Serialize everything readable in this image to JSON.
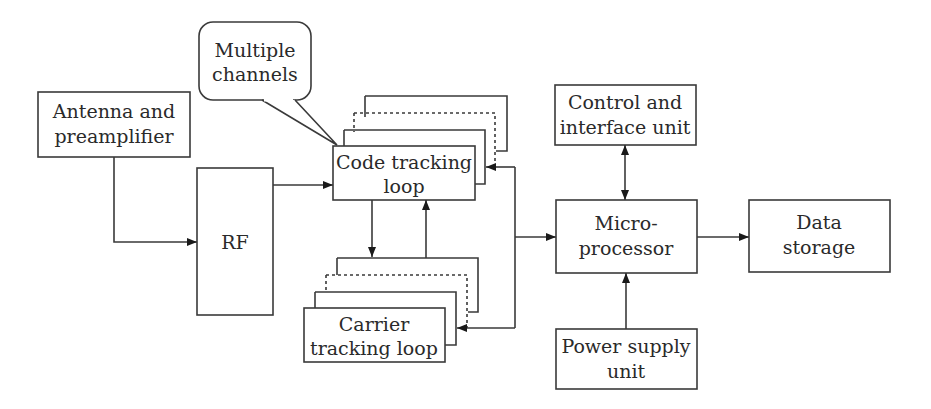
{
  "diagram": {
    "type": "block-diagram",
    "blocks": {
      "antenna": {
        "line1": "Antenna and",
        "line2": "preamplifier"
      },
      "rf": {
        "label": "RF"
      },
      "code_loop": {
        "line1": "Code tracking",
        "line2": "loop"
      },
      "carrier_loop": {
        "line1": "Carrier",
        "line2": "tracking loop"
      },
      "callout": {
        "line1": "Multiple",
        "line2": "channels"
      },
      "control": {
        "line1": "Control and",
        "line2": "interface unit"
      },
      "micro": {
        "line1": "Micro-",
        "line2": "processor"
      },
      "storage": {
        "line1": "Data",
        "line2": "storage"
      },
      "power": {
        "line1": "Power supply",
        "line2": "unit"
      }
    },
    "connections": [
      {
        "from": "Antenna and preamplifier",
        "to": "RF"
      },
      {
        "from": "RF",
        "to": "Code tracking loop"
      },
      {
        "from": "Code tracking loop",
        "to": "Carrier tracking loop"
      },
      {
        "from": "Carrier tracking loop",
        "to": "Code tracking loop"
      },
      {
        "from": "Bus",
        "to": "Code tracking loop"
      },
      {
        "from": "Bus",
        "to": "Carrier tracking loop"
      },
      {
        "from": "Bus",
        "to": "Micro-processor"
      },
      {
        "from": "Control and interface unit",
        "to": "Micro-processor",
        "bidirectional": true
      },
      {
        "from": "Micro-processor",
        "to": "Data storage"
      },
      {
        "from": "Power supply unit",
        "to": "Micro-processor"
      }
    ],
    "colors": {
      "stroke": "#3a3a3a",
      "text": "#2a2a2a",
      "background": "#ffffff"
    }
  }
}
